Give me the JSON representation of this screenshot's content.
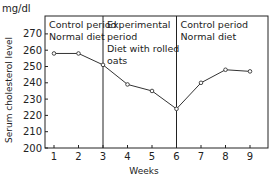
{
  "chart_data": {
    "type": "line",
    "title": "",
    "xlabel": "Weeks",
    "ylabel": "Serum cholesterol level",
    "yunit": "mg/dl",
    "x": [
      1,
      2,
      3,
      4,
      5,
      6,
      7,
      8,
      9
    ],
    "values": [
      258,
      258,
      251,
      239,
      235,
      224,
      240,
      248,
      247
    ],
    "ylim": [
      200,
      280
    ],
    "xlim": [
      0.3,
      9.7
    ],
    "yticks": [
      200,
      210,
      220,
      230,
      240,
      250,
      260,
      270
    ],
    "xticks": [
      1,
      2,
      3,
      4,
      5,
      6,
      7,
      8,
      9
    ],
    "grid": false,
    "markers": "open-circle",
    "periods": [
      {
        "label_lines": [
          "Control period",
          "Normal diet"
        ],
        "start": 0.3,
        "end": 3
      },
      {
        "label_lines": [
          "Experimental",
          "period",
          "Diet with rolled",
          "oats"
        ],
        "start": 3,
        "end": 6
      },
      {
        "label_lines": [
          "Control period",
          "Normal diet"
        ],
        "start": 6,
        "end": 9.7
      }
    ],
    "colors": {
      "line": "#333333",
      "axis": "#222222",
      "text": "#222222"
    }
  }
}
